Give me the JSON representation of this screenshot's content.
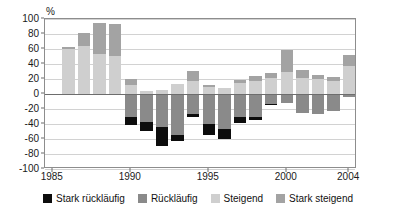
{
  "chart_data": {
    "type": "bar",
    "title": "",
    "subtitle": "",
    "xlabel": "",
    "ylabel": "%",
    "unit_label": "%",
    "ylim": [
      -100,
      100
    ],
    "yticks": [
      100,
      80,
      60,
      40,
      20,
      0,
      -20,
      -40,
      -60,
      -80,
      -100
    ],
    "ytick_labels": [
      "100",
      "80",
      "60",
      "40",
      "20",
      "0",
      "-20",
      "-40",
      "-60",
      "-80",
      "-100"
    ],
    "xtick_labels": [
      "1985",
      "1990",
      "1995",
      "2000",
      "2004"
    ],
    "xticks": [
      1985,
      1990,
      1995,
      2000,
      2004
    ],
    "grid": true,
    "stacked": true,
    "legend_position": "bottom",
    "legend": [
      {
        "name": "Stark rückläufig",
        "color": "#0d0d0d"
      },
      {
        "name": "Rückläufig",
        "color": "#8a8a8a"
      },
      {
        "name": "Steigend",
        "color": "#cfcfcf"
      },
      {
        "name": "Stark steigend",
        "color": "#a3a3a3"
      }
    ],
    "categories": [
      1986,
      1987,
      1988,
      1989,
      1990,
      1991,
      1992,
      1993,
      1994,
      1995,
      1996,
      1997,
      1998,
      1999,
      2000,
      2001,
      2002,
      2003,
      2004
    ],
    "series": [
      {
        "name": "Steigend",
        "color": "#cfcfcf",
        "values": [
          60,
          64,
          53,
          51,
          12,
          4,
          5,
          13,
          18,
          10,
          8,
          15,
          18,
          21,
          30,
          22,
          20,
          18,
          38
        ]
      },
      {
        "name": "Stark steigend",
        "color": "#a3a3a3",
        "values": [
          3,
          18,
          42,
          43,
          8,
          0,
          0,
          0,
          13,
          2,
          0,
          4,
          6,
          7,
          29,
          10,
          6,
          5,
          14
        ]
      },
      {
        "name": "Rückläufig",
        "color": "#8a8a8a",
        "values": [
          0,
          0,
          0,
          0,
          -30,
          -37,
          -44,
          -55,
          -27,
          -40,
          -47,
          -30,
          -30,
          -13,
          -12,
          -25,
          -27,
          -22,
          -4
        ]
      },
      {
        "name": "Stark rückläufig",
        "color": "#0d0d0d",
        "values": [
          0,
          0,
          0,
          0,
          -11,
          -12,
          -25,
          -8,
          -4,
          -15,
          -13,
          -8,
          -5,
          -2,
          0,
          0,
          0,
          0,
          0
        ]
      }
    ]
  }
}
